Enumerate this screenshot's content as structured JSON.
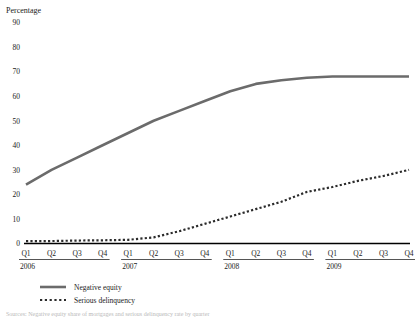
{
  "chart_data": {
    "type": "line",
    "title": "",
    "ylabel": "Percentage",
    "xlabel": "",
    "ylim": [
      0,
      90
    ],
    "yticks": [
      0,
      10,
      20,
      30,
      40,
      50,
      60,
      70,
      80,
      90
    ],
    "grid": false,
    "legend_position": "bottom-left",
    "x": [
      "2006 Q1",
      "2006 Q2",
      "2006 Q3",
      "2006 Q4",
      "2007 Q1",
      "2007 Q2",
      "2007 Q3",
      "2007 Q4",
      "2008 Q1",
      "2008 Q2",
      "2008 Q3",
      "2008 Q4",
      "2009 Q1",
      "2009 Q2",
      "2009 Q3",
      "2009 Q4"
    ],
    "categories": [
      "Q1",
      "Q2",
      "Q3",
      "Q4",
      "Q1",
      "Q2",
      "Q3",
      "Q4",
      "Q1",
      "Q2",
      "Q3",
      "Q4",
      "Q1",
      "Q2",
      "Q3",
      "Q4"
    ],
    "year_groups": [
      {
        "label": "2006",
        "quarters": [
          "Q1",
          "Q2",
          "Q3",
          "Q4"
        ]
      },
      {
        "label": "2007",
        "quarters": [
          "Q1",
          "Q2",
          "Q3",
          "Q4"
        ]
      },
      {
        "label": "2008",
        "quarters": [
          "Q1",
          "Q2",
          "Q3",
          "Q4"
        ]
      },
      {
        "label": "2009",
        "quarters": [
          "Q1",
          "Q2",
          "Q3",
          "Q4"
        ]
      }
    ],
    "series": [
      {
        "name": "Negative equity",
        "style": "solid",
        "color": "#6b6b6b",
        "width": 2.6,
        "values": [
          24,
          30,
          35,
          40,
          45,
          50,
          54,
          58,
          62,
          65,
          66.5,
          67.5,
          68,
          68,
          68,
          68
        ]
      },
      {
        "name": "Serious delinquency",
        "style": "dotted",
        "color": "#2b2b2b",
        "width": 2.2,
        "values": [
          1,
          1,
          1.2,
          1.3,
          1.5,
          2.5,
          5,
          8,
          11,
          14,
          17,
          21,
          23,
          25.5,
          27.5,
          30
        ]
      }
    ]
  },
  "legend": {
    "items": [
      {
        "label": "Negative equity",
        "style": "solid",
        "color": "#6b6b6b"
      },
      {
        "label": "Serious delinquency",
        "style": "dotted",
        "color": "#2b2b2b"
      }
    ]
  },
  "footnote": {
    "text": "Sources: Negative equity share of mortgages and serious delinquency rate by quarter"
  },
  "colors": {
    "axis": "#000000",
    "negative_equity": "#6b6b6b",
    "serious_delinquency": "#2b2b2b",
    "text": "#1a1a1a"
  }
}
